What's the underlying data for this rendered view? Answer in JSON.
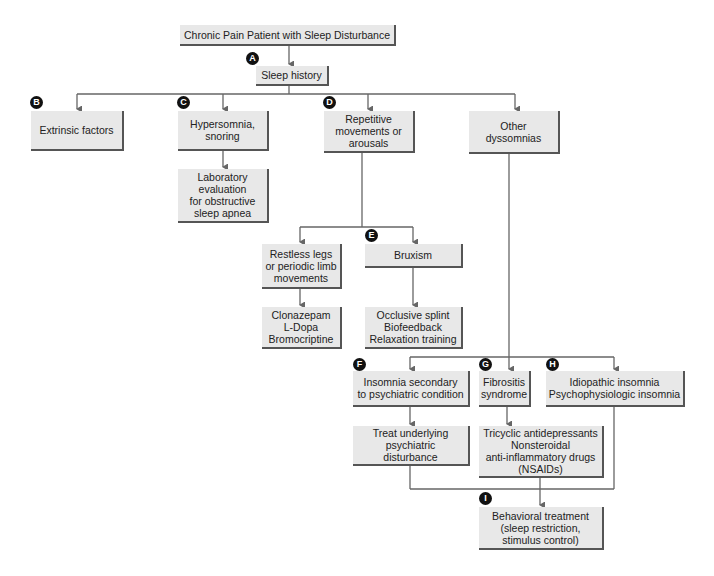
{
  "diagram": {
    "title": "Chronic Pain Patient with Sleep Disturbance",
    "nodes": {
      "root": "Chronic Pain Patient with Sleep Disturbance",
      "sleep_history": "Sleep history",
      "extrinsic": "Extrinsic factors",
      "hypersomnia": "Hypersomnia,\nsnoring",
      "lab_eval": "Laboratory\nevaluation\nfor obstructive\nsleep apnea",
      "repetitive": "Repetitive\nmovements or\narousals",
      "other_dyssomnias": "Other\ndyssomnias",
      "restless_legs": "Restless legs\nor periodic limb\nmovements",
      "bruxism": "Bruxism",
      "clonazepam": "Clonazepam\nL-Dopa\nBromocriptine",
      "occlusive": "Occlusive splint\nBiofeedback\nRelaxation training",
      "insomnia_psych": "Insomnia secondary\nto psychiatric condition",
      "fibrositis": "Fibrositis\nsyndrome",
      "idiopathic": "Idiopathic insomnia\nPsychophysiologic insomnia",
      "treat_psych": "Treat underlying\npsychiatric\ndisturbance",
      "tricyclic": "Tricyclic antidepressants\nNonsteroidal\nanti-inflammatory drugs\n(NSAIDs)",
      "behavioral": "Behavioral treatment\n(sleep restriction,\nstimulus control)"
    },
    "badges": {
      "a": "A",
      "b": "B",
      "c": "C",
      "d": "D",
      "e": "E",
      "f": "F",
      "g": "G",
      "h": "H",
      "i": "I"
    },
    "colors": {
      "box_fill": "#e8e8e8",
      "box_shadow": "#555555",
      "line": "#666666",
      "badge": "#111111"
    }
  }
}
